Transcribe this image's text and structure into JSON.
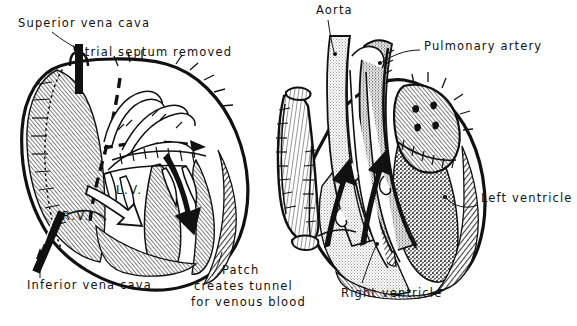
{
  "figure": {
    "title_present": false,
    "background_color": "#ffffff",
    "ink_color": "#111111",
    "type": "medical-illustration",
    "panels": [
      {
        "id": "left-panel",
        "name": "atrial-baffle-view",
        "description": "Opened right atrium, atrial septum removed, patch creating venous tunnel"
      },
      {
        "id": "right-panel",
        "name": "great-vessel-view",
        "description": "Completed repair showing aorta, pulmonary artery and both ventricles"
      }
    ]
  },
  "labels": {
    "superior_vena_cava": "Superior vena cava",
    "atrial_septum_removed": "Atrial septum removed",
    "inferior_vena_cava": "Inferior vena cava",
    "patch_line1": "Patch",
    "patch_line2": "creates tunnel",
    "patch_line3": "for venous blood",
    "lv": "L.V.",
    "rv": "R.V.",
    "aorta": "Aorta",
    "pulmonary_artery": "Pulmonary artery",
    "left_ventricle": "Left ventricle",
    "right_ventricle": "Right ventricle"
  },
  "colors": {
    "ink": "#111111",
    "white": "#ffffff",
    "light_stipple": "#d8d8d8",
    "mid_stipple": "#b4b4b4",
    "dark_stipple": "#8a8a8a",
    "muscle_tint": "#efefef"
  },
  "flow_arrows": [
    {
      "name": "lv-inflow-arrow",
      "style": "solid-black",
      "panel": "left-panel",
      "label": "L.V."
    },
    {
      "name": "rv-outflow-arrow",
      "style": "hollow-white",
      "panel": "left-panel",
      "label": "R.V."
    },
    {
      "name": "atrial-dashed-arrow",
      "style": "dashed-black",
      "panel": "left-panel",
      "label": ""
    },
    {
      "name": "aortic-flow-arrow",
      "style": "solid-black",
      "panel": "right-panel",
      "label": ""
    },
    {
      "name": "pulmonary-flow-arrow",
      "style": "solid-black",
      "panel": "right-panel",
      "label": ""
    }
  ]
}
